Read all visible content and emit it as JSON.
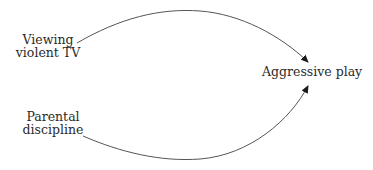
{
  "diagram": {
    "type": "causal-path-diagram",
    "nodes": [
      {
        "id": "viewing",
        "lines": [
          "Viewing",
          "violent TV"
        ]
      },
      {
        "id": "parental",
        "lines": [
          "Parental",
          "discipline"
        ]
      },
      {
        "id": "aggressive",
        "lines": [
          "Aggressive play"
        ]
      }
    ],
    "edges": [
      {
        "from": "viewing",
        "to": "aggressive",
        "style": "curved-arrow-up"
      },
      {
        "from": "parental",
        "to": "aggressive",
        "style": "curved-arrow-down"
      }
    ],
    "colors": {
      "line": "#555555",
      "arrowhead": "#1a1a1a",
      "text": "#2a2a2a",
      "background": "#ffffff"
    }
  }
}
